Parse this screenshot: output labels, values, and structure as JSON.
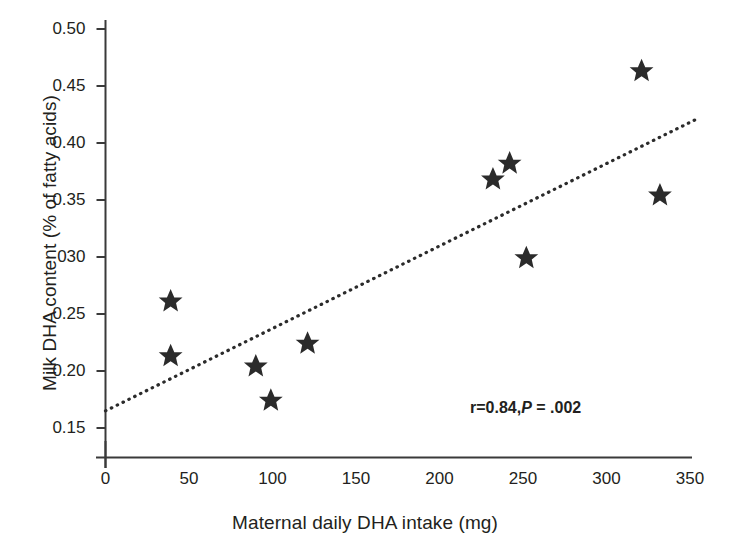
{
  "chart_data": {
    "type": "scatter",
    "title": "",
    "xlabel": "Maternal daily DHA intake (mg)",
    "ylabel": "Milk DHA content (% of fatty acids)",
    "xlim": [
      0,
      350
    ],
    "ylim": [
      0.15,
      0.5
    ],
    "xticks": [
      0,
      50,
      100,
      150,
      200,
      250,
      300,
      350
    ],
    "xtick_labels": [
      "0",
      "50",
      "100",
      "150",
      "200",
      "250",
      "300",
      "350"
    ],
    "yticks": [
      0.15,
      0.2,
      0.25,
      0.3,
      0.35,
      0.4,
      0.45,
      0.5
    ],
    "ytick_labels": [
      "0.15",
      "0.20",
      "0.25",
      "030",
      "0.35",
      "0.40",
      "0.45",
      "0.50"
    ],
    "grid": false,
    "legend": null,
    "marker": "star",
    "marker_color": "#2b2b2b",
    "points": [
      {
        "x": 39,
        "y": 0.261
      },
      {
        "x": 39,
        "y": 0.213
      },
      {
        "x": 90,
        "y": 0.204
      },
      {
        "x": 99,
        "y": 0.174
      },
      {
        "x": 121,
        "y": 0.224
      },
      {
        "x": 232,
        "y": 0.368
      },
      {
        "x": 242,
        "y": 0.382
      },
      {
        "x": 252,
        "y": 0.299
      },
      {
        "x": 321,
        "y": 0.463
      },
      {
        "x": 332,
        "y": 0.354
      }
    ],
    "trendline": {
      "style": "dotted",
      "color": "#2b2b2b",
      "x0": 0,
      "y0": 0.165,
      "x1": 354,
      "y1": 0.421
    },
    "annotations": [
      {
        "name": "correlation-stats",
        "r_text": "r=0.84,",
        "p_italic": "P",
        "p_text": " = .002"
      }
    ]
  },
  "axes": {
    "x_title": "Maternal daily DHA intake (mg)",
    "y_title": "Milk DHA content (% of fatty acids)"
  }
}
